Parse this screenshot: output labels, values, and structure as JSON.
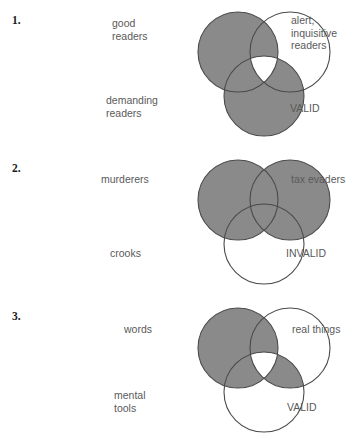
{
  "page": {
    "style": {
      "shade_color": "#8a8a8a",
      "stroke_color": "#4a4a4a",
      "text_color": "#5a5a5a",
      "number_color": "#1b1b1b",
      "background": "#ffffff"
    }
  },
  "problems": [
    {
      "number": "1.",
      "labels": {
        "top_left": "good\nreaders",
        "top_right": "alert,\ninquisitive\nreaders",
        "bottom_left": "demanding\nreaders",
        "verdict": "VALID"
      },
      "shading": {
        "left_only": true,
        "right_only": false,
        "bottom_only": true,
        "left_right": true,
        "left_bottom": true,
        "right_bottom": false,
        "center": false
      }
    },
    {
      "number": "2.",
      "labels": {
        "top_left": "murderers",
        "top_right": "tax evaders",
        "bottom_left": "crooks",
        "verdict": "INVALID"
      },
      "shading": {
        "left_only": true,
        "right_only": true,
        "bottom_only": false,
        "left_right": true,
        "left_bottom": true,
        "right_bottom": true,
        "center": true
      }
    },
    {
      "number": "3.",
      "labels": {
        "top_left": "words",
        "top_right": "real things",
        "bottom_left": "mental\ntools",
        "verdict": "VALID"
      },
      "shading": {
        "left_only": true,
        "right_only": false,
        "bottom_only": false,
        "left_right": true,
        "left_bottom": true,
        "right_bottom": true,
        "center": false
      }
    }
  ]
}
